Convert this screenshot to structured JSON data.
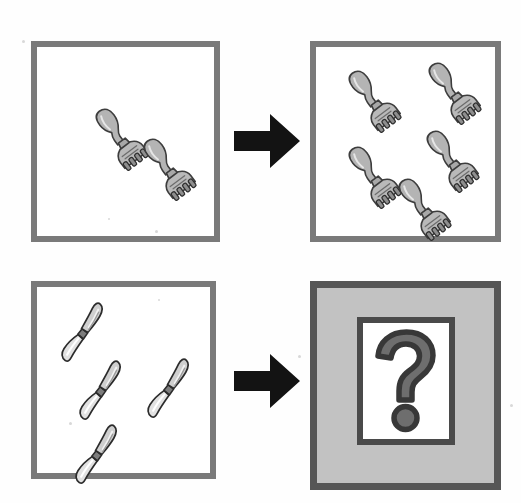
{
  "puzzle": {
    "type": "visual-analogy",
    "title": "Cutlery counting analogy",
    "relation_label": "",
    "background_color": "#ffffff",
    "border_color": "#7a7a7a",
    "answer_fill_color": "#c2c2c2",
    "answer_border_color": "#565656",
    "arrow_color": "#111111",
    "question_mark_fill": "#6e6e6e",
    "question_mark_stroke": "#3a3a3a",
    "question_mark_glyph": "?",
    "panels": [
      {
        "id": "top-left",
        "position": "top-left",
        "role": "source-A",
        "object_type": "fork",
        "count": 2,
        "fill_style": "white",
        "items": [
          {
            "x": 44,
            "y": 52,
            "rotation": -37
          },
          {
            "x": 92,
            "y": 82,
            "rotation": -37
          }
        ]
      },
      {
        "id": "top-right",
        "position": "top-right",
        "role": "result-B",
        "object_type": "fork",
        "count": 5,
        "fill_style": "white",
        "items": [
          {
            "x": 18,
            "y": 14,
            "rotation": -37
          },
          {
            "x": 98,
            "y": 6,
            "rotation": -37
          },
          {
            "x": 18,
            "y": 90,
            "rotation": -37
          },
          {
            "x": 96,
            "y": 74,
            "rotation": -37
          },
          {
            "x": 68,
            "y": 122,
            "rotation": -37
          }
        ]
      },
      {
        "id": "bottom-left",
        "position": "bottom-left",
        "role": "source-C",
        "object_type": "knife",
        "count": 4,
        "fill_style": "white",
        "items": [
          {
            "x": 6,
            "y": 6,
            "rotation": -30
          },
          {
            "x": 24,
            "y": 64,
            "rotation": -30
          },
          {
            "x": 92,
            "y": 62,
            "rotation": -30
          },
          {
            "x": 20,
            "y": 128,
            "rotation": -30
          }
        ]
      },
      {
        "id": "bottom-right",
        "position": "bottom-right",
        "role": "answer-unknown",
        "object_type": "question-mark",
        "count": null,
        "fill_style": "gray",
        "items": []
      }
    ],
    "arrows": [
      {
        "id": "arrow-top",
        "direction": "right",
        "from": "top-left",
        "to": "top-right"
      },
      {
        "id": "arrow-bottom",
        "direction": "right",
        "from": "bottom-left",
        "to": "bottom-right"
      }
    ],
    "specks": [
      {
        "x": 22,
        "y": 40,
        "size": 3
      },
      {
        "x": 155,
        "y": 230,
        "size": 3
      },
      {
        "x": 108,
        "y": 218,
        "size": 2
      },
      {
        "x": 510,
        "y": 404,
        "size": 3
      },
      {
        "x": 69,
        "y": 422,
        "size": 3
      },
      {
        "x": 298,
        "y": 355,
        "size": 3
      },
      {
        "x": 158,
        "y": 299,
        "size": 2
      }
    ]
  }
}
